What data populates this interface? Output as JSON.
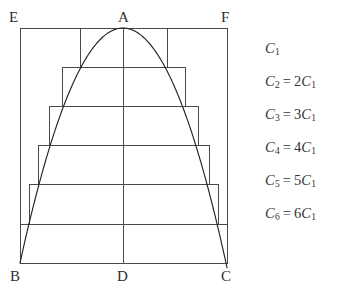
{
  "figure": {
    "stroke_color": "#4a4a4a",
    "curve_color": "#232323",
    "background": "#ffffff",
    "vertices": [
      {
        "id": "E",
        "label": "E",
        "x": 20,
        "y": 28,
        "label_x": 9,
        "label_y": 22
      },
      {
        "id": "A",
        "label": "A",
        "x": 123,
        "y": 28,
        "label_x": 118,
        "label_y": 22
      },
      {
        "id": "F",
        "label": "F",
        "x": 227,
        "y": 28,
        "label_x": 221,
        "label_y": 22
      },
      {
        "id": "B",
        "label": "B",
        "x": 20,
        "y": 263,
        "label_x": 10,
        "label_y": 281
      },
      {
        "id": "D",
        "label": "D",
        "x": 123,
        "y": 263,
        "label_x": 117,
        "label_y": 281
      },
      {
        "id": "C",
        "label": "C",
        "x": 227,
        "y": 263,
        "label_x": 221,
        "label_y": 281
      }
    ],
    "outer_rect": {
      "x": 20,
      "y": 28,
      "width": 207,
      "height": 235
    },
    "axis_line": {
      "x1": 123,
      "y1": 28,
      "x2": 123,
      "y2": 263
    },
    "inner_rects": [
      {
        "name": "C1",
        "x": 80,
        "y": 28,
        "width": 87,
        "height": 39
      },
      {
        "name": "C2",
        "x": 62,
        "y": 67,
        "width": 123,
        "height": 39
      },
      {
        "name": "C3",
        "x": 49,
        "y": 106,
        "width": 149,
        "height": 39
      },
      {
        "name": "C4",
        "x": 38,
        "y": 145,
        "width": 171,
        "height": 39
      },
      {
        "name": "C5",
        "x": 29,
        "y": 184,
        "width": 189,
        "height": 40
      },
      {
        "name": "C6",
        "x": 20,
        "y": 224,
        "width": 207,
        "height": 39
      }
    ],
    "parabola": {
      "apex_x": 123,
      "apex_y": 28,
      "left_x": 20,
      "right_x": 227,
      "base_y": 263
    }
  },
  "legend": {
    "rows": [
      {
        "lhs": "C",
        "lhs_sub": "1",
        "eq": "",
        "rhs_coef": "",
        "rhs": "",
        "rhs_sub": ""
      },
      {
        "lhs": "C",
        "lhs_sub": "2",
        "eq": "=",
        "rhs_coef": "2",
        "rhs": "C",
        "rhs_sub": "1"
      },
      {
        "lhs": "C",
        "lhs_sub": "3",
        "eq": "=",
        "rhs_coef": "3",
        "rhs": "C",
        "rhs_sub": "1"
      },
      {
        "lhs": "C",
        "lhs_sub": "4",
        "eq": "=",
        "rhs_coef": "4",
        "rhs": "C",
        "rhs_sub": "1"
      },
      {
        "lhs": "C",
        "lhs_sub": "5",
        "eq": "=",
        "rhs_coef": "5",
        "rhs": "C",
        "rhs_sub": "1"
      },
      {
        "lhs": "C",
        "lhs_sub": "6",
        "eq": "=",
        "rhs_coef": "6",
        "rhs": "C",
        "rhs_sub": "1"
      }
    ]
  }
}
